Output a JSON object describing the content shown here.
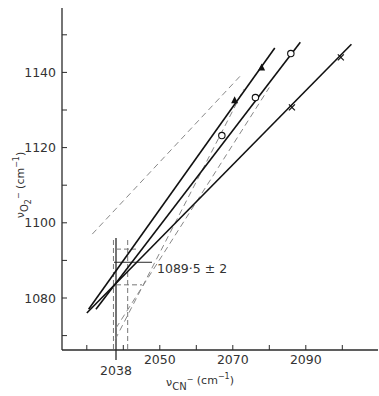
{
  "chart_data": {
    "type": "scatter",
    "title": "",
    "xlabel": "ν CN⁻ (cm⁻¹)",
    "ylabel": "ν O₂⁻ (cm⁻¹)",
    "xlim": [
      2028,
      2105
    ],
    "ylim": [
      1062,
      1158
    ],
    "x_ticks": [
      2030,
      2040,
      2050,
      2060,
      2070,
      2080,
      2090,
      2100
    ],
    "x_tick_labels": [
      "2050",
      "2070",
      "2090"
    ],
    "x_tick_label_values": [
      2050,
      2070,
      2090
    ],
    "x_special_label": "2038",
    "x_special_value": 2038,
    "y_ticks": [
      1070,
      1080,
      1090,
      1100,
      1110,
      1120,
      1130,
      1140,
      1150
    ],
    "y_tick_labels": [
      "1080",
      "1100",
      "1120",
      "1140"
    ],
    "y_tick_label_values": [
      1080,
      1100,
      1120,
      1140
    ],
    "grid": false,
    "annotation": "1089·5 ± 2",
    "annotation_value": 1089.5,
    "intersection": {
      "x": 2038,
      "y": 1089.5,
      "x_error_lines": [
        2037.3,
        2041.2
      ]
    },
    "series": [
      {
        "name": "filled-triangle",
        "marker": "triangle-filled",
        "points": [
          [
            2070.5,
            1132.6
          ],
          [
            2077.9,
            1141.3
          ]
        ],
        "fit_line": [
          [
            2030.5,
            1077.0
          ],
          [
            2081.5,
            1146.5
          ]
        ]
      },
      {
        "name": "open-circle",
        "marker": "circle-open",
        "points": [
          [
            2067.0,
            1123.2
          ],
          [
            2076.2,
            1133.3
          ],
          [
            2085.9,
            1145.0
          ]
        ],
        "fit_line": [
          [
            2032.5,
            1077.0
          ],
          [
            2088.5,
            1148.0
          ]
        ]
      },
      {
        "name": "cross",
        "marker": "cross",
        "points": [
          [
            2086.2,
            1130.7
          ],
          [
            2099.6,
            1144.0
          ]
        ],
        "fit_line": [
          [
            2030.0,
            1076.0
          ],
          [
            2102.5,
            1147.5
          ]
        ]
      }
    ],
    "dashed_lines": [
      [
        [
          2037.8,
          1069.0
        ],
        [
          2073.0,
          1135.5
        ]
      ],
      [
        [
          2031.5,
          1097.0
        ],
        [
          2072.0,
          1139.0
        ]
      ],
      [
        [
          2038.0,
          1072.0
        ],
        [
          2080.0,
          1136.0
        ]
      ]
    ]
  }
}
